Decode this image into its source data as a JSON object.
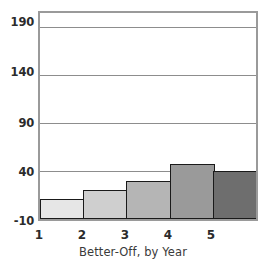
{
  "chart_data": {
    "type": "bar",
    "title": "",
    "subtitle": "",
    "xlabel": "Better-Off, by Year",
    "ylabel": "",
    "categories": [
      "1",
      "2",
      "3",
      "4",
      "5"
    ],
    "values": [
      11,
      20,
      30,
      47,
      40
    ],
    "ylim": [
      -10,
      205
    ],
    "yticks": [
      -10,
      40,
      90,
      140,
      190
    ],
    "ytick_labels": [
      "-10",
      "40",
      "90",
      "140",
      "190"
    ],
    "grid": true,
    "grid_axis": "y",
    "legend": "none",
    "bar_colors": [
      "#e6e6e6",
      "#cfcfcf",
      "#b5b5b5",
      "#9a9a9a",
      "#6e6e6e"
    ],
    "bar_edge_color": "#1a1a1a",
    "frame_color": "#9a9a9a",
    "background_color": "#ffffff",
    "annotations": []
  },
  "axes": {
    "y": {
      "ticks": [
        {
          "label": "190",
          "value": 190
        },
        {
          "label": "140",
          "value": 140
        },
        {
          "label": "90",
          "value": 90
        },
        {
          "label": "40",
          "value": 40
        },
        {
          "label": "-10",
          "value": -10
        }
      ]
    },
    "x": {
      "title": "Better-Off, by Year",
      "ticks": [
        {
          "label": "1"
        },
        {
          "label": "2"
        },
        {
          "label": "3"
        },
        {
          "label": "4"
        },
        {
          "label": "5"
        }
      ]
    }
  }
}
